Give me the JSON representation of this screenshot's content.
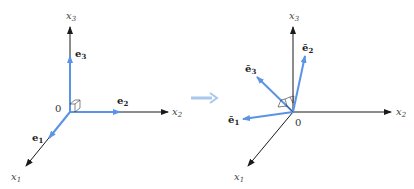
{
  "left_frame": {
    "origin_label": "0",
    "axes": [
      {
        "name": "x1",
        "label": "x",
        "sub": "1"
      },
      {
        "name": "x2",
        "label": "x",
        "sub": "2"
      },
      {
        "name": "x3",
        "label": "x",
        "sub": "3"
      }
    ],
    "basis": [
      {
        "name": "e1",
        "label": "e",
        "sub": "1"
      },
      {
        "name": "e2",
        "label": "e",
        "sub": "2"
      },
      {
        "name": "e3",
        "label": "e",
        "sub": "3"
      }
    ]
  },
  "right_frame": {
    "origin_label": "0",
    "axes": [
      {
        "name": "x1",
        "label": "x",
        "sub": "1"
      },
      {
        "name": "x2",
        "label": "x",
        "sub": "2"
      },
      {
        "name": "x3",
        "label": "x",
        "sub": "3"
      }
    ],
    "basis": [
      {
        "name": "e-bar-1",
        "label": "ē",
        "sub": "1"
      },
      {
        "name": "e-bar-2",
        "label": "ē",
        "sub": "2"
      },
      {
        "name": "e-bar-3",
        "label": "ē",
        "sub": "3"
      }
    ]
  },
  "colors": {
    "axis": "#1a1a1a",
    "basis": "#5b93e6",
    "transition_arrow": "#a9c8ec"
  }
}
